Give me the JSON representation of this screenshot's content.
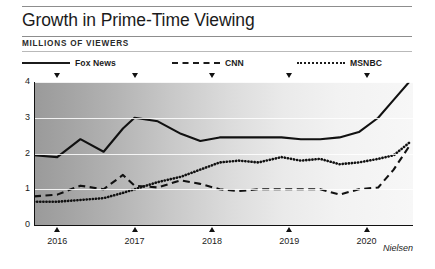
{
  "header": {
    "title": "Growth in Prime-Time Viewing",
    "subtitle": "MILLIONS OF VIEWERS"
  },
  "legend": [
    {
      "label": "Fox News",
      "style": "solid"
    },
    {
      "label": "CNN",
      "style": "dashed"
    },
    {
      "label": "MSNBC",
      "style": "dotted"
    }
  ],
  "source": "Nielsen",
  "chart_data": {
    "type": "line",
    "title": "Growth in Prime-Time Viewing",
    "subtitle": "MILLIONS OF VIEWERS",
    "xlabel": "",
    "ylabel": "MILLIONS OF VIEWERS",
    "ylim": [
      0,
      4
    ],
    "xlim": [
      2015.7,
      2020.6
    ],
    "yticks": [
      0,
      1,
      2,
      3,
      4
    ],
    "ytick_labels": [
      "0",
      "1",
      "2",
      "3",
      "4"
    ],
    "xticks": [
      2016,
      2017,
      2018,
      2019,
      2020
    ],
    "xtick_labels": [
      "2016",
      "2017",
      "2018",
      "2019",
      "2020"
    ],
    "grid": true,
    "legend_position": "top",
    "background": "horizontal gradient dark-gray to white",
    "series": [
      {
        "name": "Fox News",
        "style": "solid",
        "x": [
          2015.7,
          2016.0,
          2016.3,
          2016.6,
          2016.85,
          2017.0,
          2017.3,
          2017.6,
          2017.85,
          2018.1,
          2018.35,
          2018.6,
          2018.9,
          2019.15,
          2019.4,
          2019.65,
          2019.9,
          2020.15,
          2020.35,
          2020.55
        ],
        "y": [
          1.95,
          1.9,
          2.4,
          2.05,
          2.7,
          3.0,
          2.9,
          2.55,
          2.35,
          2.45,
          2.45,
          2.45,
          2.45,
          2.4,
          2.4,
          2.45,
          2.6,
          3.0,
          3.5,
          4.0
        ]
      },
      {
        "name": "CNN",
        "style": "dashed",
        "x": [
          2015.7,
          2016.0,
          2016.3,
          2016.6,
          2016.85,
          2017.0,
          2017.3,
          2017.6,
          2017.85,
          2018.1,
          2018.35,
          2018.6,
          2018.9,
          2019.15,
          2019.4,
          2019.65,
          2019.9,
          2020.15,
          2020.35,
          2020.55
        ],
        "y": [
          0.8,
          0.85,
          1.1,
          1.0,
          1.4,
          1.1,
          1.05,
          1.25,
          1.15,
          1.0,
          0.95,
          1.0,
          1.0,
          1.0,
          1.0,
          0.85,
          1.0,
          1.05,
          1.55,
          2.2
        ]
      },
      {
        "name": "MSNBC",
        "style": "dotted",
        "x": [
          2015.7,
          2016.0,
          2016.3,
          2016.6,
          2016.85,
          2017.0,
          2017.3,
          2017.6,
          2017.85,
          2018.1,
          2018.35,
          2018.6,
          2018.9,
          2019.15,
          2019.4,
          2019.65,
          2019.9,
          2020.15,
          2020.35,
          2020.55
        ],
        "y": [
          0.65,
          0.65,
          0.7,
          0.75,
          0.9,
          1.0,
          1.2,
          1.35,
          1.55,
          1.75,
          1.8,
          1.75,
          1.9,
          1.8,
          1.85,
          1.7,
          1.75,
          1.85,
          1.95,
          2.3
        ]
      }
    ]
  }
}
